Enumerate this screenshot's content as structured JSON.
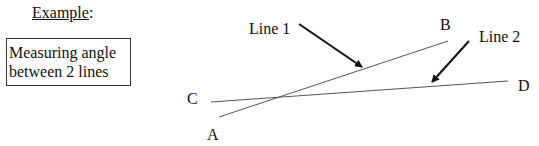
{
  "heading": {
    "text": "Example",
    "suffix": ":"
  },
  "caption_box": {
    "line1": "Measuring angle",
    "line2": "between 2 lines"
  },
  "points": {
    "A": "A",
    "B": "B",
    "C": "C",
    "D": "D"
  },
  "annotations": {
    "line1": "Line 1",
    "line2": "Line 2"
  },
  "colors": {
    "line": "#555555",
    "arrow": "#111111",
    "text": "#111111"
  }
}
